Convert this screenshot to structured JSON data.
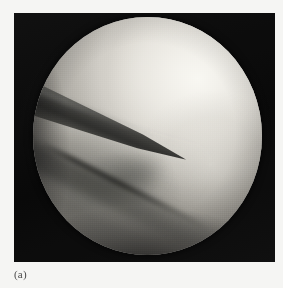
{
  "figure": {
    "caption": "(a)",
    "kind": "arthroscopic-photograph",
    "modality_label": "arthroscopy",
    "page_background_color": "#f5f5f3",
    "frame": {
      "name": "scope-frame",
      "background_color": "#0c0c0c",
      "x": 14,
      "y": 13,
      "width": 261,
      "height": 249
    },
    "field_of_view": {
      "shape": "circle",
      "x": 33,
      "y": 17,
      "width": 229,
      "height": 238,
      "base_color": "#8e8e8e",
      "highlight_color": "#ecead4",
      "shadow_color": "#2a2a28"
    },
    "features": [
      {
        "name": "femoral-condyle",
        "description": "large smooth bright convex cartilage surface filling the upper right of the field",
        "tone": "bright",
        "color": "#ecebe5"
      },
      {
        "name": "arthroscopic-probe",
        "description": "dark tapering instrument entering from the left rim and pointing toward the centre",
        "tone": "dark",
        "color": "#3a3a38"
      },
      {
        "name": "joint-cleft",
        "description": "diagonal dark groove running from upper left to lower right between the condyle and the opposing surface",
        "tone": "dark",
        "color": "#444440"
      },
      {
        "name": "lower-tissue",
        "description": "mid-grey shadowed tissue mass occupying the lower left quadrant",
        "tone": "mid",
        "color": "#7e7e79"
      },
      {
        "name": "rim-vignette",
        "description": "darkening of the image toward the circular rim of the endoscope field",
        "tone": "dark",
        "color": "#141414"
      }
    ]
  }
}
